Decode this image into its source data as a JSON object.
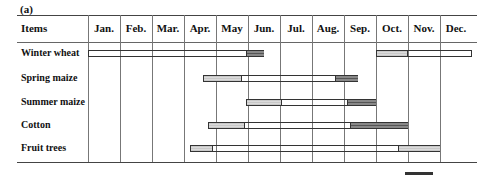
{
  "panel_label": "(a)",
  "header": {
    "items_label": "Items",
    "months": [
      "Jan.",
      "Feb.",
      "Mar.",
      "Apr.",
      "May",
      "Jun.",
      "Jul.",
      "Aug.",
      "Sep.",
      "Oct.",
      "Nov.",
      "Dec."
    ]
  },
  "rows": [
    {
      "label": "Winter wheat"
    },
    {
      "label": "Spring maize"
    },
    {
      "label": "Summer maize"
    },
    {
      "label": "Cotton"
    },
    {
      "label": "Fruit trees"
    }
  ],
  "legend": {
    "partial_text": "l  - l  - f  - l  -"
  },
  "colors": {
    "light_stage": "#d0d0d0",
    "hatched_stage": "#333333",
    "dark_stage": "#666666",
    "grid": "#777777"
  },
  "chart_data": {
    "type": "gantt",
    "title": "(a)",
    "xlabel": "Month",
    "ylabel": "Items",
    "categories": [
      "Jan.",
      "Feb.",
      "Mar.",
      "Apr.",
      "May",
      "Jun.",
      "Jul.",
      "Aug.",
      "Sep.",
      "Oct.",
      "Nov.",
      "Dec."
    ],
    "x_range_months": [
      0,
      12
    ],
    "grid": true,
    "note": "Month positions are in fractional months from start of Jan. (0) to end of Dec. (12). Segment styles: light=dotted/light grey, hatched=diagonal hatch, dark=dark grey.",
    "series": [
      {
        "name": "Winter wheat",
        "segments": [
          {
            "style": "hatched",
            "start": 0.0,
            "end": 4.9
          },
          {
            "style": "dark",
            "start": 4.9,
            "end": 5.5
          },
          {
            "style": "light",
            "start": 9.0,
            "end": 9.95
          },
          {
            "style": "hatched",
            "start": 9.95,
            "end": 12.0
          }
        ]
      },
      {
        "name": "Spring maize",
        "segments": [
          {
            "style": "light",
            "start": 3.6,
            "end": 4.75
          },
          {
            "style": "hatched",
            "start": 4.75,
            "end": 7.7
          },
          {
            "style": "dark",
            "start": 7.7,
            "end": 8.45
          }
        ]
      },
      {
        "name": "Summer maize",
        "segments": [
          {
            "style": "light",
            "start": 4.95,
            "end": 6.0
          },
          {
            "style": "hatched",
            "start": 6.0,
            "end": 8.05
          },
          {
            "style": "dark",
            "start": 8.05,
            "end": 9.0
          }
        ]
      },
      {
        "name": "Cotton",
        "segments": [
          {
            "style": "light",
            "start": 3.75,
            "end": 4.85
          },
          {
            "style": "hatched",
            "start": 4.85,
            "end": 8.15
          },
          {
            "style": "dark",
            "start": 8.15,
            "end": 10.0
          }
        ]
      },
      {
        "name": "Fruit trees",
        "segments": [
          {
            "style": "light",
            "start": 3.2,
            "end": 3.85
          },
          {
            "style": "hatched",
            "start": 3.85,
            "end": 9.65
          },
          {
            "style": "light",
            "start": 9.65,
            "end": 11.0
          }
        ]
      }
    ]
  }
}
